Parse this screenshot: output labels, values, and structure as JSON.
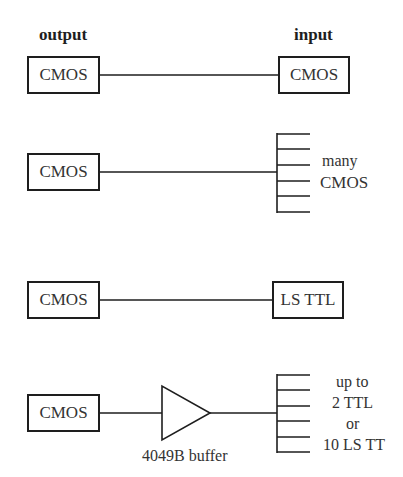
{
  "headers": {
    "output": "output",
    "input": "input"
  },
  "rows": [
    {
      "driver": "CMOS",
      "load": "CMOS",
      "load_type": "single"
    },
    {
      "driver": "CMOS",
      "load_lines": [
        "many",
        "CMOS"
      ],
      "load_type": "fanout",
      "fanout_count": 6
    },
    {
      "driver": "CMOS",
      "load": "LS TTL",
      "load_type": "single"
    },
    {
      "driver": "CMOS",
      "buffer": "4049B buffer",
      "load_lines": [
        "up to",
        "2 TTL",
        "or",
        "10 LS TT"
      ],
      "load_type": "fanout",
      "fanout_count": 6
    }
  ],
  "colors": {
    "line": "#1e1e1e",
    "text": "#333333",
    "background": "#ffffff"
  }
}
